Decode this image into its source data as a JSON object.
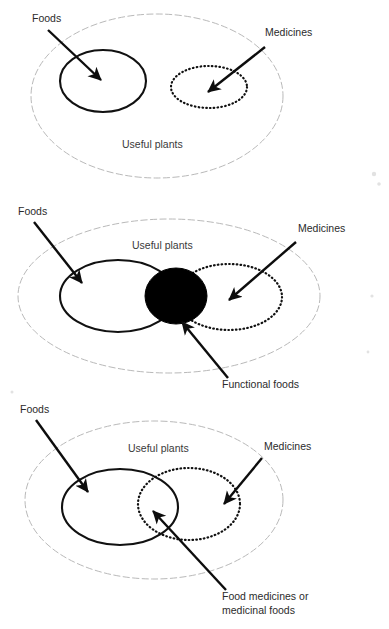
{
  "figure": {
    "type": "venn-diagram-set",
    "background_color": "#ffffff",
    "ink_color": "#111111",
    "outer_boundary_color": "#b9b9b9",
    "panel_count": 3
  },
  "panels": [
    {
      "id": "panel-1",
      "caption": "Separate sets: foods and medicines do not overlap",
      "universe": {
        "label": "Useful plants",
        "style": "dashed-ellipse",
        "cx": 157,
        "cy": 96,
        "rx": 126,
        "ry": 82,
        "label_x": 122,
        "label_y": 148
      },
      "sets": [
        {
          "name": "Foods",
          "style": "solid-ellipse",
          "cx": 103,
          "cy": 81,
          "rx": 43,
          "ry": 31,
          "label": "Foods",
          "label_x": 32,
          "label_y": 22,
          "arrow": {
            "x1": 48,
            "y1": 30,
            "x2": 101,
            "y2": 80
          }
        },
        {
          "name": "Medicines",
          "style": "dotted-ellipse",
          "cx": 209,
          "cy": 87,
          "rx": 38,
          "ry": 21,
          "label": "Medicines",
          "label_x": 265,
          "label_y": 36,
          "arrow": {
            "x1": 265,
            "y1": 47,
            "x2": 208,
            "y2": 92
          }
        }
      ],
      "intersection": null
    },
    {
      "id": "panel-2",
      "caption": "Overlap shaded solid: functional foods",
      "universe": {
        "label": "Useful plants",
        "style": "dashed-ellipse",
        "cx": 169,
        "cy": 296,
        "rx": 151,
        "ry": 77,
        "label_x": 132,
        "label_y": 249
      },
      "sets": [
        {
          "name": "Foods",
          "style": "solid-ellipse",
          "cx": 118,
          "cy": 296,
          "rx": 58,
          "ry": 36,
          "label": "Foods",
          "label_x": 18,
          "label_y": 215,
          "arrow": {
            "x1": 34,
            "y1": 222,
            "x2": 82,
            "y2": 283
          }
        },
        {
          "name": "Medicines",
          "style": "dotted-ellipse",
          "cx": 229,
          "cy": 297,
          "rx": 53,
          "ry": 33,
          "label": "Medicines",
          "label_x": 298,
          "label_y": 232,
          "arrow": {
            "x1": 296,
            "y1": 242,
            "x2": 229,
            "y2": 300
          }
        }
      ],
      "intersection": {
        "name": "Functional foods",
        "style": "filled-ellipse",
        "cx": 176,
        "cy": 296,
        "rx": 31,
        "ry": 28,
        "label": "Functional foods",
        "label_x": 222,
        "label_y": 388,
        "arrow": {
          "x1": 228,
          "y1": 378,
          "x2": 182,
          "y2": 322
        }
      }
    },
    {
      "id": "panel-3",
      "caption": "Partial overlap: food medicines or medicinal foods",
      "universe": {
        "label": "Useful plants",
        "style": "dashed-ellipse",
        "cx": 154,
        "cy": 500,
        "rx": 129,
        "ry": 79,
        "label_x": 128,
        "label_y": 452
      },
      "sets": [
        {
          "name": "Foods",
          "style": "solid-ellipse",
          "cx": 120,
          "cy": 507,
          "rx": 58,
          "ry": 38,
          "label": "Foods",
          "label_x": 20,
          "label_y": 413,
          "arrow": {
            "x1": 36,
            "y1": 420,
            "x2": 88,
            "y2": 492
          }
        },
        {
          "name": "Medicines",
          "style": "dotted-ellipse",
          "cx": 189,
          "cy": 504,
          "rx": 51,
          "ry": 36,
          "label": "Medicines",
          "label_x": 264,
          "label_y": 450,
          "arrow": {
            "x1": 262,
            "y1": 458,
            "x2": 224,
            "y2": 504
          }
        }
      ],
      "intersection": {
        "name": "Food medicines or medicinal foods",
        "style": "lens-overlap",
        "label_line_1": "Food medicines or",
        "label_line_2": "medicinal foods",
        "label_x": 222,
        "label_y": 600,
        "arrow": {
          "x1": 226,
          "y1": 590,
          "x2": 153,
          "y2": 511
        }
      }
    }
  ],
  "text_labels": {
    "foods": "Foods",
    "medicines": "Medicines",
    "useful_plants": "Useful plants",
    "functional_foods": "Functional foods",
    "food_medicines_line1": "Food medicines or",
    "food_medicines_line2": "medicinal foods"
  }
}
